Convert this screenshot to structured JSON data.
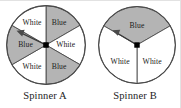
{
  "figure": {
    "background_color": "#ffffff",
    "border_color": "#e2e2e2",
    "outline_color": "#4a4a4a",
    "blue_fill_color": "#b4b4b4",
    "white_fill_color": "#ffffff",
    "pivot_color": "#000000",
    "text_color": "#1a1a1a"
  },
  "spinners": [
    {
      "id": "spinner-a",
      "caption": "Spinner A",
      "sector_count": 6,
      "sector_angle_degrees": 60,
      "pointer_direction_degrees": 205,
      "pointer_target_label": "Blue",
      "sectors": [
        {
          "index": 0,
          "label": "Blue",
          "fill": "blue",
          "start_deg": -90,
          "end_deg": -30
        },
        {
          "index": 1,
          "label": "White",
          "fill": "white",
          "start_deg": -30,
          "end_deg": 30
        },
        {
          "index": 2,
          "label": "Blue",
          "fill": "blue",
          "start_deg": 30,
          "end_deg": 90
        },
        {
          "index": 3,
          "label": "White",
          "fill": "white",
          "start_deg": 90,
          "end_deg": 150
        },
        {
          "index": 4,
          "label": "Blue",
          "fill": "blue",
          "start_deg": 150,
          "end_deg": 210
        },
        {
          "index": 5,
          "label": "White",
          "fill": "white",
          "start_deg": 210,
          "end_deg": 270
        }
      ]
    },
    {
      "id": "spinner-b",
      "caption": "Spinner B",
      "sector_count": 3,
      "sector_angle_degrees": 120,
      "pointer_direction_degrees": 210,
      "pointer_target_label": "Blue",
      "sectors": [
        {
          "index": 0,
          "label": "Blue",
          "fill": "blue",
          "start_deg": 210,
          "end_deg": 330
        },
        {
          "index": 1,
          "label": "White",
          "fill": "white",
          "start_deg": 330,
          "end_deg": 90
        },
        {
          "index": 2,
          "label": "White",
          "fill": "white",
          "start_deg": 90,
          "end_deg": 210
        }
      ]
    }
  ],
  "labels": {
    "a_sector_0": "Blue",
    "a_sector_1": "White",
    "a_sector_2": "Blue",
    "a_sector_3": "White",
    "a_sector_4": "Blue",
    "a_sector_5": "White",
    "b_sector_0": "Blue",
    "b_sector_1": "White",
    "b_sector_2": "White",
    "caption_a": "Spinner A",
    "caption_b": "Spinner B"
  }
}
